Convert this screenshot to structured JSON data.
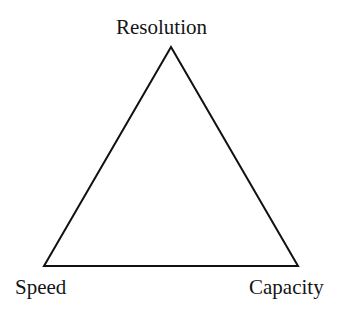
{
  "diagram": {
    "type": "triangle",
    "vertices": {
      "top": {
        "label": "Resolution",
        "x": 171,
        "y": 47
      },
      "bottom_left": {
        "label": "Speed",
        "x": 44,
        "y": 266
      },
      "bottom_right": {
        "label": "Capacity",
        "x": 298,
        "y": 266
      }
    },
    "stroke_color": "#111111",
    "background_color": "#ffffff"
  }
}
